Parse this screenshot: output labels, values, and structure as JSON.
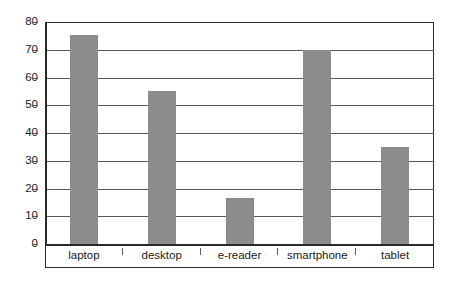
{
  "chart_data": {
    "type": "bar",
    "title": "",
    "subtitle": "",
    "xlabel": "",
    "ylabel": "",
    "categories": [
      "laptop",
      "desktop",
      "e-reader",
      "smartphone",
      "tablet"
    ],
    "values": [
      75.5,
      55,
      16.5,
      70,
      35
    ],
    "ylim": [
      0,
      80
    ],
    "ytick_interval": 10,
    "yticks": [
      80,
      70,
      60,
      50,
      40,
      30,
      20,
      10,
      0
    ],
    "ytick_labels": [
      "80",
      "70",
      "60",
      "50",
      "40",
      "30",
      "20",
      "10",
      "0"
    ],
    "xticks": [
      "laptop",
      "desktop",
      "e-reader",
      "smartphone",
      "tablet"
    ],
    "grid": true,
    "grid_axis": "y",
    "legend": false,
    "legend_position": "none",
    "annotations": [],
    "colors": {
      "bar_fill": "#8c8c8c",
      "gridline": "#585858",
      "frame": "#2b2b2b",
      "axis": "#2b2b2b",
      "text": "#1a1a1a",
      "background": "#ffffff"
    }
  }
}
